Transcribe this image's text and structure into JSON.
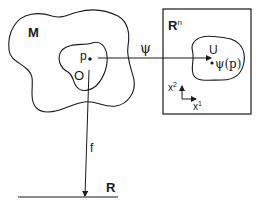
{
  "figure": {
    "manifold_label": "M",
    "open_set_label": "O",
    "point_label": "p",
    "chart_map_label": "ψ",
    "function_label": "f",
    "euclidean_space_label": "R",
    "euclidean_space_superscript": "n",
    "image_set_label": "U",
    "image_point_label": "ψ(p)",
    "axis_x1_label": "x",
    "axis_x1_superscript": "1",
    "axis_x2_label": "x",
    "axis_x2_superscript": "2",
    "real_line_label": "R"
  },
  "colors": {
    "ink": "#1a1a1a",
    "background": "#ffffff"
  }
}
